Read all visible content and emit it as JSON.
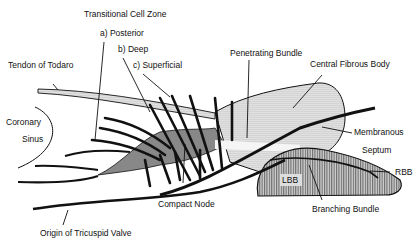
{
  "diagram": {
    "colors": {
      "ink": "#111111",
      "stipple": "#bdbdbd",
      "dense_stipple": "#8f8f8f",
      "hatch": "#9a9a9a",
      "background": "#ffffff"
    },
    "labels": {
      "transitional_cell_zone": "Transitional Cell Zone",
      "posterior": "a) Posterior",
      "deep": "b) Deep",
      "superficial": "c) Superficial",
      "tendon_of_todaro": "Tendon of Todaro",
      "coronary": "Coronary",
      "sinus": "Sinus",
      "penetrating_bundle": "Penetrating Bundle",
      "central_fibrous_body": "Central Fibrous Body",
      "membranous": "Membranous",
      "septum": "Septum",
      "rbb": "RBB",
      "lbb": "LBB",
      "branching_bundle": "Branching Bundle",
      "compact_node": "Compact Node",
      "origin_of_tricuspid_valve": "Origin of Tricuspid Valve"
    }
  }
}
